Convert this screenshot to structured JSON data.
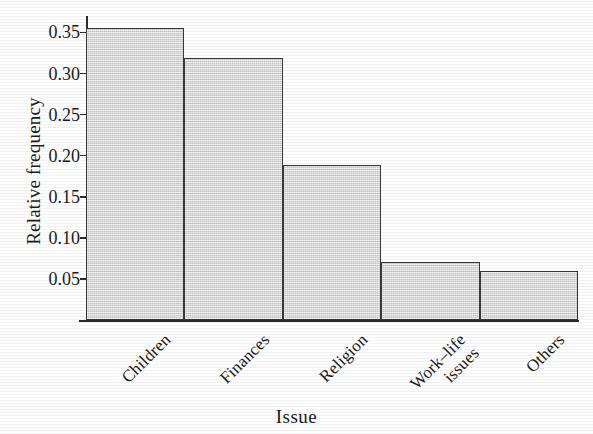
{
  "chart_data": {
    "type": "bar",
    "title": "",
    "subtitle": "",
    "xlabel": "Issue",
    "ylabel": "Relative frequency",
    "categories": [
      "Children",
      "Finances",
      "Religion",
      "Work–life\nissues",
      "Others"
    ],
    "values": [
      0.356,
      0.319,
      0.189,
      0.07,
      0.06
    ],
    "ylim": [
      0,
      0.37
    ],
    "yticks": [
      0.05,
      0.1,
      0.15,
      0.2,
      0.25,
      0.3,
      0.35
    ],
    "ytick_labels": [
      "0.05",
      "0.10",
      "0.15",
      "0.20",
      "0.25",
      "0.30",
      "0.35"
    ],
    "grid": false,
    "legend": null,
    "bar_fill_color": "#d6d6d6",
    "bar_edge_color": "#383838",
    "axis_color": "#2b2b2b",
    "bars_contiguous": true,
    "category_label_rotation_deg": -45,
    "annotations": []
  },
  "axes": {
    "y_title": "Relative frequency",
    "x_title": "Issue"
  }
}
